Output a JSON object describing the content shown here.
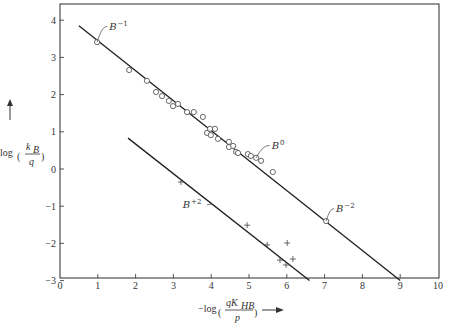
{
  "chart_data": {
    "type": "scatter",
    "title": "",
    "xlabel": "-log(qK_HB / p)",
    "ylabel": "log(k_B / q)",
    "xlim": [
      0,
      10
    ],
    "ylim": [
      -3,
      4.3
    ],
    "x_ticks": [
      0,
      1,
      2,
      3,
      4,
      5,
      6,
      7,
      8,
      9,
      10
    ],
    "y_ticks": [
      4,
      3,
      2,
      1,
      0,
      -1,
      -2,
      -3
    ],
    "grid": false,
    "legend": null,
    "series": [
      {
        "name": "upper series (circles)",
        "marker": "circle",
        "points": [
          [
            0.98,
            3.41
          ],
          [
            1.83,
            2.66
          ],
          [
            2.3,
            2.37
          ],
          [
            2.54,
            2.07
          ],
          [
            2.7,
            1.96
          ],
          [
            2.88,
            1.83
          ],
          [
            2.99,
            1.69
          ],
          [
            3.12,
            1.75
          ],
          [
            3.36,
            1.53
          ],
          [
            3.54,
            1.53
          ],
          [
            3.78,
            1.4
          ],
          [
            3.89,
            0.97
          ],
          [
            3.97,
            1.08
          ],
          [
            3.99,
            0.91
          ],
          [
            4.1,
            1.08
          ],
          [
            4.18,
            0.81
          ],
          [
            4.47,
            0.73
          ],
          [
            4.47,
            0.59
          ],
          [
            4.58,
            0.62
          ],
          [
            4.66,
            0.46
          ],
          [
            4.71,
            0.43
          ],
          [
            4.97,
            0.4
          ],
          [
            5.05,
            0.35
          ],
          [
            5.19,
            0.3
          ],
          [
            5.32,
            0.22
          ],
          [
            5.63,
            -0.08
          ],
          [
            7.04,
            -1.4
          ]
        ]
      },
      {
        "name": "lower series (crosses)",
        "marker": "plus",
        "points": [
          [
            3.2,
            -0.35
          ],
          [
            4.95,
            -1.51
          ],
          [
            5.48,
            -2.04
          ],
          [
            6.01,
            -1.99
          ],
          [
            5.82,
            -2.45
          ],
          [
            5.98,
            -2.58
          ],
          [
            6.16,
            -2.42
          ]
        ]
      }
    ],
    "fit_lines": [
      {
        "name": "upper fit",
        "from": [
          0.5,
          3.85
        ],
        "to": [
          9.0,
          -3.0
        ]
      },
      {
        "name": "lower fit",
        "from": [
          1.8,
          0.83
        ],
        "to": [
          6.6,
          -3.0
        ]
      }
    ],
    "annotations": [
      {
        "text": "B",
        "sup": "-1",
        "target": [
          0.98,
          3.41
        ],
        "label_at": [
          1.3,
          3.75
        ]
      },
      {
        "text": "B",
        "sup": "0",
        "target": [
          5.19,
          0.3
        ],
        "label_at": [
          5.6,
          0.55
        ]
      },
      {
        "text": "B",
        "sup": "-2",
        "target": [
          7.04,
          -1.4
        ],
        "label_at": [
          7.3,
          -1.15
        ]
      },
      {
        "text": "B",
        "sup": "+2",
        "target": [
          4.0,
          -0.95
        ],
        "label_at": [
          3.3,
          -1.05
        ]
      }
    ]
  },
  "axes": {
    "x_title_prefix": "−log",
    "x_title_num": "qK",
    "x_title_sub": "HB",
    "x_title_den": "p",
    "y_title_prefix": "log",
    "y_title_num": "k",
    "y_title_sub": "B",
    "y_title_den": "q"
  }
}
